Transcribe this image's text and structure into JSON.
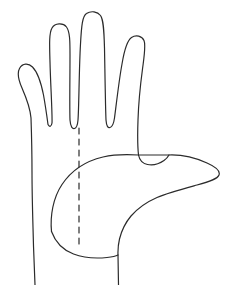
{
  "figure": {
    "name": "hand-outline-diagram",
    "title": "Hand outline with midline",
    "background_color": "#ffffff",
    "stroke_color": "#2b2b2b",
    "stroke_width": 1.2,
    "canvas": {
      "width": 231,
      "height": 285
    }
  },
  "drawing": {
    "type": "line-art",
    "subject": "open human hand, palm view, fingers extended upward, thumb extended to the right",
    "orientation": "palm-up",
    "parts": [
      {
        "id": "pinky-finger",
        "label": "Pinky finger",
        "tip": [
          26,
          68
        ]
      },
      {
        "id": "ring-finger",
        "label": "Ring finger",
        "tip": [
          61,
          26
        ]
      },
      {
        "id": "middle-finger",
        "label": "Middle finger",
        "tip": [
          95,
          14
        ]
      },
      {
        "id": "index-finger",
        "label": "Index finger",
        "tip": [
          139,
          38
        ]
      },
      {
        "id": "thumb",
        "label": "Thumb",
        "tip": [
          219,
          176
        ]
      },
      {
        "id": "palm",
        "label": "Palm"
      },
      {
        "id": "wrist",
        "label": "Wrist"
      }
    ],
    "guide_line": {
      "id": "midline",
      "label": "Midline",
      "style": "dashed",
      "orientation": "vertical",
      "x": 79,
      "y_start": 128,
      "y_end": 246,
      "dash_pattern": "6 5"
    },
    "outline_path": "M 35 285 L 33.5 246 C 33.0 225 32.0 198 32.0 172 C 32.0 153 31.5 133 31.0 118 C 30.0 106 25.5 96 22.0 88 C 18.5 80 17.0 73 19.5 68.5 C 22.5 63.0 28.5 63.0 32.5 67.0 C 36.5 71.0 40.5 80.0 43.5 95.0 C 45.5 106 47.0 117 48.0 124.5 C 49.5 127.5 51.5 126.5 52.0 123.0 C 52.5 114 50.5 84 50.0 62.0 C 49.5 45.0 49.0 33.0 52.0 28.0 C 55.0 23.0 63.0 22.5 66.5 27.0 C 70.0 31.5 70.0 42.0 70.0 55.0 C 70.0 76.0 69.5 107 70.0 120.0 C 70.5 127.0 72.5 129.0 74.5 128.5 C 76.5 128.0 77.5 126.0 78.0 120.0 C 79.0 107 79.0 70.0 80.5 44.0 C 81.5 25.0 82.5 16.0 86.5 13.5 C 91.0 10.5 97.5 11.5 100.5 15.5 C 103.5 19.5 104.0 30.0 104.5 48.0 C 105.0 75.0 105.5 110 106.0 120.0 C 106.5 126.5 108.0 128.0 110.0 127.5 C 112.0 127.0 113.5 125.0 114.5 118.0 C 116.0 107 119.0 80.0 122.0 64.0 C 124.5 49.0 127.0 40.5 131.5 37.5 C 136.0 34.5 142.0 36.0 144.0 40.5 C 146.0 45.0 144.5 54.0 142.5 69.0 C 140.5 84.0 138.5 104 138.0 120.0 C 137.5 134 137.5 146 138.5 155.0 L 169.0 155.0 C 182.0 154.5 197.0 158.5 207.0 163.0 C 216.0 167.0 220.5 171.0 219.0 175.0 C 217.5 179.0 210.0 181.5 197.0 185.0 C 184.0 188.5 168.5 192.5 157.0 197.5 C 145.5 202.5 138.0 208.0 131.0 216.0 C 125.5 222.5 121.5 231.0 119.5 239.0 C 118.2 244.5 117.8 250.0 118.0 255.0 L 118.5 285",
    "palm_arc_path": "M 51.5 231.5 C 50.0 216.0 53.0 198.0 62.0 184.5 C 71.0 171.0 86.0 161.0 103.0 157.0 C 115.0 154.2 127.5 154.3 138.5 155.0",
    "palm_bottom_path": "M 51.5 231.5 C 55.5 242.5 63.0 250.0 73.5 254.0 C 84.0 258.0 97.0 258.5 107.0 257.5 C 112.0 257.0 115.8 256.2 118.0 255.0",
    "index-base-notch_path": "M 138.5 155.0 C 139.5 160.0 142.5 163.5 147.5 164.5 C 152.5 165.5 159.0 164.0 164.0 160.5 C 166.5 158.8 168.0 156.8 169.0 155.0"
  }
}
